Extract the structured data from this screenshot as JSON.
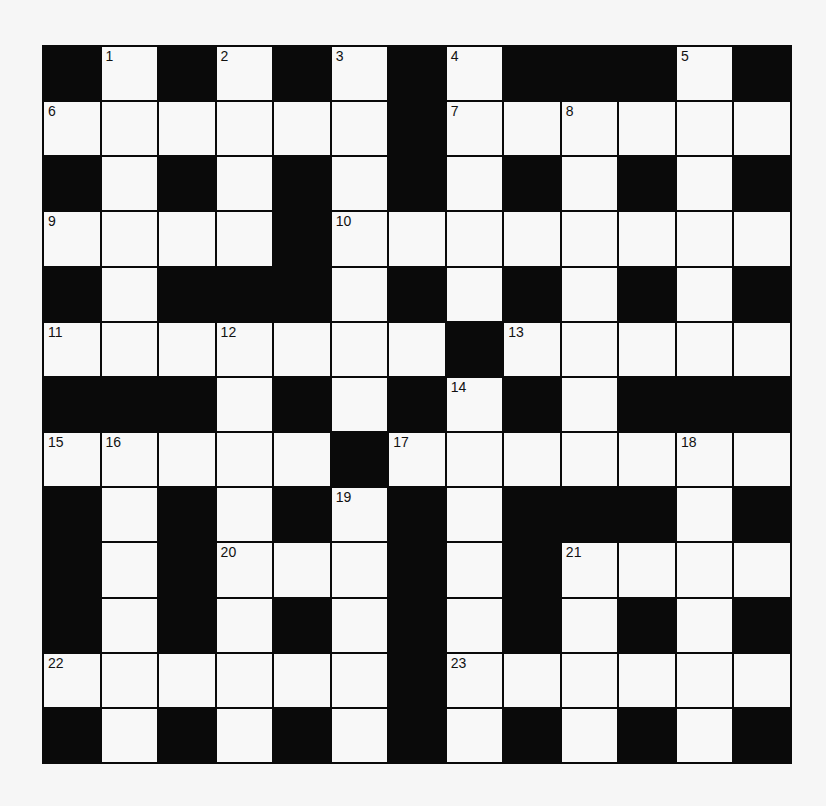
{
  "puzzle": {
    "rows": 13,
    "cols": 13,
    "colors": {
      "block": "#0a0a0a",
      "cell": "#f8f8f8",
      "background": "#f6f6f6"
    },
    "legend": "# = black square, . = white square, number = numbered white square",
    "grid": [
      [
        "#",
        "1",
        "#",
        "2",
        "#",
        "3",
        "#",
        "4",
        "#",
        "#",
        "#",
        "5",
        "#"
      ],
      [
        "6",
        ".",
        ".",
        ".",
        ".",
        ".",
        "#",
        "7",
        ".",
        "8",
        ".",
        ".",
        "."
      ],
      [
        "#",
        ".",
        "#",
        ".",
        "#",
        ".",
        "#",
        ".",
        "#",
        ".",
        "#",
        ".",
        "#"
      ],
      [
        "9",
        ".",
        ".",
        ".",
        "#",
        "10",
        ".",
        ".",
        ".",
        ".",
        ".",
        ".",
        "."
      ],
      [
        "#",
        ".",
        "#",
        "#",
        "#",
        ".",
        "#",
        ".",
        "#",
        ".",
        "#",
        ".",
        "#"
      ],
      [
        "11",
        ".",
        ".",
        "12",
        ".",
        ".",
        ".",
        "#",
        "13",
        ".",
        ".",
        ".",
        "."
      ],
      [
        "#",
        "#",
        "#",
        ".",
        "#",
        ".",
        "#",
        "14",
        "#",
        ".",
        "#",
        "#",
        "#"
      ],
      [
        "15",
        "16",
        ".",
        ".",
        ".",
        "#",
        "17",
        ".",
        ".",
        ".",
        ".",
        "18",
        "."
      ],
      [
        "#",
        ".",
        "#",
        ".",
        "#",
        "19",
        "#",
        ".",
        "#",
        "#",
        "#",
        ".",
        "#"
      ],
      [
        "#",
        ".",
        "#",
        "20",
        ".",
        ".",
        "#",
        ".",
        "#",
        "21",
        ".",
        ".",
        "."
      ],
      [
        "#",
        ".",
        "#",
        ".",
        "#",
        ".",
        "#",
        ".",
        "#",
        ".",
        "#",
        ".",
        "#"
      ],
      [
        "22",
        ".",
        ".",
        ".",
        ".",
        ".",
        "#",
        "23",
        ".",
        ".",
        ".",
        ".",
        "."
      ],
      [
        "#",
        ".",
        "#",
        ".",
        "#",
        ".",
        "#",
        ".",
        "#",
        ".",
        "#",
        ".",
        "#"
      ]
    ],
    "clue_numbers": [
      "1",
      "2",
      "3",
      "4",
      "5",
      "6",
      "7",
      "8",
      "9",
      "10",
      "11",
      "12",
      "13",
      "14",
      "15",
      "16",
      "17",
      "18",
      "19",
      "20",
      "21",
      "22",
      "23"
    ]
  }
}
